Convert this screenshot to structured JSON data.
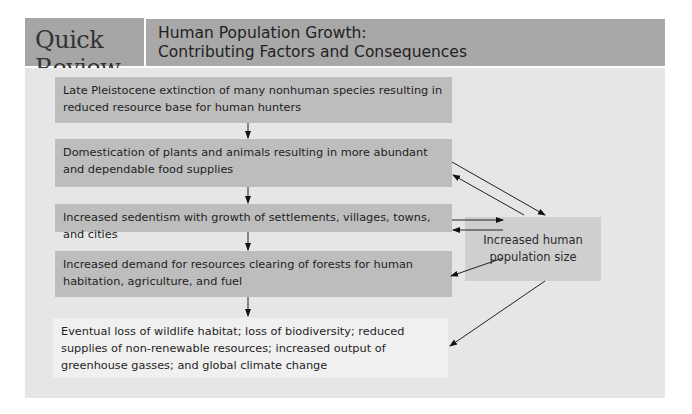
{
  "header": {
    "badge": "Quick Review",
    "title_line1": "Human Population Growth:",
    "title_line2": "Contributing Factors and Consequences"
  },
  "flow": [
    {
      "id": "extinction",
      "text": "Late Pleistocene extinction of many nonhuman species resulting in reduced resource base for human hunters"
    },
    {
      "id": "domestication",
      "text": "Domestication of plants and animals resulting in more abundant and dependable food supplies"
    },
    {
      "id": "sedentism",
      "text": "Increased sedentism with growth of settlements, villages, towns, and cities"
    },
    {
      "id": "demand",
      "text": "Increased demand for resources clearing of forests for human habitation, agriculture, and fuel"
    },
    {
      "id": "consequences",
      "text": "Eventual loss of wildlife habitat; loss of biodiversity; reduced supplies of non-renewable resources; increased output of greenhouse gasses; and global climate change"
    }
  ],
  "population_box": {
    "text": "Increased human population size"
  },
  "connections": [
    {
      "from": "extinction",
      "to": "domestication"
    },
    {
      "from": "domestication",
      "to": "sedentism"
    },
    {
      "from": "sedentism",
      "to": "demand"
    },
    {
      "from": "demand",
      "to": "consequences"
    },
    {
      "from": "domestication",
      "to": "population_box"
    },
    {
      "from": "population_box",
      "to": "domestication"
    },
    {
      "from": "sedentism",
      "to": "population_box"
    },
    {
      "from": "population_box",
      "to": "sedentism"
    },
    {
      "from": "population_box",
      "to": "demand"
    },
    {
      "from": "population_box",
      "to": "consequences"
    }
  ],
  "colors": {
    "header_bg": "#a8a8a8",
    "panel_bg": "#e6e6e6",
    "box_dark": "#bdbdbd",
    "box_light": "#f0f0f0",
    "population_box": "#cfcfcf"
  }
}
